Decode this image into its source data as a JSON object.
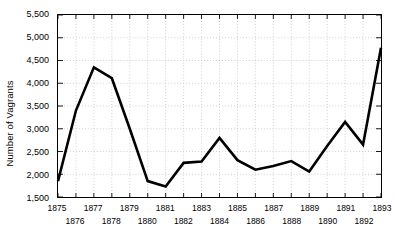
{
  "chart_data": {
    "type": "line",
    "title": "",
    "subtitle": "",
    "xlabel": "",
    "ylabel": "Number of Vagrants",
    "x": [
      1875,
      1876,
      1877,
      1878,
      1879,
      1880,
      1881,
      1882,
      1883,
      1884,
      1885,
      1886,
      1887,
      1888,
      1889,
      1890,
      1891,
      1892,
      1893
    ],
    "categories": [
      "1875",
      "1876",
      "1877",
      "1878",
      "1879",
      "1880",
      "1881",
      "1882",
      "1883",
      "1884",
      "1885",
      "1886",
      "1887",
      "1888",
      "1889",
      "1890",
      "1891",
      "1892",
      "1893"
    ],
    "values": [
      1850,
      3400,
      4350,
      4110,
      3000,
      1850,
      1730,
      2250,
      2280,
      2800,
      2310,
      2100,
      2180,
      2290,
      2060,
      2620,
      3150,
      2650,
      4780
    ],
    "series": [
      {
        "name": "Number of Vagrants",
        "values": [
          1850,
          3400,
          4350,
          4110,
          3000,
          1850,
          1730,
          2250,
          2280,
          2800,
          2310,
          2100,
          2180,
          2290,
          2060,
          2620,
          3150,
          2650,
          4780
        ]
      }
    ],
    "xlim": [
      1875,
      1893
    ],
    "ylim": [
      1500,
      5500
    ],
    "ytick_values": [
      1500,
      2000,
      2500,
      3000,
      3500,
      4000,
      4500,
      5000,
      5500
    ],
    "ytick_labels": [
      "1,500",
      "2,000",
      "2,500",
      "3,000",
      "3,500",
      "4,000",
      "4,500",
      "5,000",
      "5,500"
    ],
    "grid": true,
    "grid_style": "dotted",
    "legend": false,
    "legend_position": "none",
    "line_color": "#000000",
    "line_width": 2.6,
    "grid_color": "#b9b9b9",
    "axis_color": "#000000",
    "background_color": "#ffffff",
    "xtick_label_rows": [
      {
        "row": 0,
        "labels": [
          "1875",
          "1877",
          "1879",
          "1881",
          "1883",
          "1885",
          "1888",
          "1890",
          "1892"
        ]
      },
      {
        "row": 1,
        "labels": [
          "1876",
          "1878",
          "1880",
          "1882",
          "1884",
          "1887",
          "1889",
          "1891",
          "1893"
        ]
      }
    ],
    "xtick_row_assignment": [
      0,
      1,
      0,
      1,
      0,
      1,
      0,
      1,
      0,
      1,
      0,
      1,
      0,
      1,
      0,
      1,
      0,
      1,
      0
    ]
  }
}
